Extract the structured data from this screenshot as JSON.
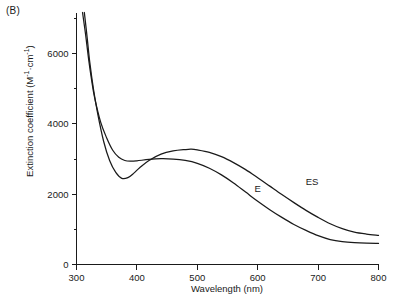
{
  "panel": {
    "label": "(B)"
  },
  "chart_data": {
    "type": "line",
    "title": "",
    "xlabel": "Wavelength (nm)",
    "ylabel_text": "Extinction coefficient (M",
    "ylabel_sup1": "-1",
    "ylabel_mid": "·cm",
    "ylabel_sup2": "-1",
    "ylabel_end": ")",
    "ylabel": "Extinction coefficient (M-1·cm-1)",
    "xlim": [
      300,
      800
    ],
    "ylim": [
      0,
      7170
    ],
    "xticks": [
      300,
      400,
      500,
      600,
      700,
      800
    ],
    "xtick_labels": [
      "300",
      "400",
      "500",
      "600",
      "700",
      "800"
    ],
    "yticks": [
      0,
      2000,
      4000,
      6000
    ],
    "ytick_labels": [
      "0",
      "2000",
      "4000",
      "6000"
    ],
    "yminor_ticks": [
      1000,
      3000,
      5000,
      7000
    ],
    "grid": false,
    "legend_position": "inline-annotation",
    "series": [
      {
        "name": "E",
        "label": "E",
        "label_x": 600,
        "label_y": 2050,
        "x": [
          310,
          315,
          320,
          325,
          330,
          340,
          350,
          360,
          370,
          380,
          390,
          400,
          420,
          440,
          460,
          480,
          500,
          520,
          540,
          560,
          580,
          600,
          620,
          640,
          660,
          680,
          700,
          720,
          740,
          760,
          780,
          800
        ],
        "y": [
          7170,
          6550,
          5850,
          5250,
          4750,
          4050,
          3600,
          3250,
          3050,
          2960,
          2940,
          2950,
          2990,
          3010,
          3000,
          2960,
          2880,
          2740,
          2550,
          2320,
          2060,
          1800,
          1560,
          1340,
          1140,
          970,
          820,
          710,
          650,
          620,
          605,
          600
        ]
      },
      {
        "name": "ES",
        "label": "ES",
        "label_x": 690,
        "label_y": 2250,
        "x": [
          313,
          318,
          322,
          328,
          335,
          345,
          355,
          365,
          375,
          385,
          395,
          405,
          420,
          440,
          460,
          480,
          490,
          500,
          520,
          540,
          560,
          580,
          600,
          620,
          640,
          660,
          680,
          700,
          720,
          740,
          760,
          780,
          800
        ],
        "y": [
          7170,
          6400,
          5750,
          5000,
          4300,
          3500,
          2950,
          2620,
          2450,
          2470,
          2600,
          2760,
          2960,
          3140,
          3230,
          3270,
          3280,
          3260,
          3190,
          3070,
          2900,
          2700,
          2470,
          2230,
          1990,
          1760,
          1540,
          1340,
          1160,
          1020,
          920,
          865,
          830
        ]
      }
    ]
  }
}
